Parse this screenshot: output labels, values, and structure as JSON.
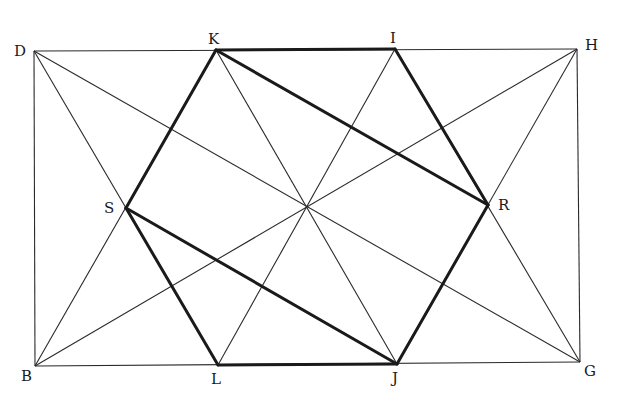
{
  "figure": {
    "type": "geometric-construction",
    "points": {
      "D": {
        "x": 34,
        "y": 51,
        "label": "D",
        "lx": 14,
        "ly": 56
      },
      "K": {
        "x": 216,
        "y": 50,
        "label": "K",
        "lx": 208,
        "ly": 44
      },
      "I": {
        "x": 395,
        "y": 49,
        "label": "I",
        "lx": 390,
        "ly": 43
      },
      "H": {
        "x": 577,
        "y": 49,
        "label": "H",
        "lx": 585,
        "ly": 50
      },
      "S": {
        "x": 126,
        "y": 208,
        "label": "S",
        "lx": 104,
        "ly": 213
      },
      "R": {
        "x": 488,
        "y": 205,
        "label": "R",
        "lx": 498,
        "ly": 210
      },
      "B": {
        "x": 35,
        "y": 366,
        "label": "B",
        "lx": 21,
        "ly": 381
      },
      "L": {
        "x": 218,
        "y": 365,
        "label": "L",
        "lx": 211,
        "ly": 384
      },
      "J": {
        "x": 397,
        "y": 364,
        "label": "J",
        "lx": 392,
        "ly": 383
      },
      "G": {
        "x": 580,
        "y": 362,
        "label": "G",
        "lx": 584,
        "ly": 376
      }
    },
    "thin_lines": [
      [
        "D",
        "H"
      ],
      [
        "H",
        "G"
      ],
      [
        "G",
        "B"
      ],
      [
        "B",
        "D"
      ],
      [
        "D",
        "G"
      ],
      [
        "B",
        "H"
      ],
      [
        "K",
        "J"
      ],
      [
        "I",
        "L"
      ],
      [
        "D",
        "L"
      ],
      [
        "B",
        "K"
      ],
      [
        "H",
        "J"
      ],
      [
        "G",
        "I"
      ]
    ],
    "thick_lines": [
      [
        "K",
        "I"
      ],
      [
        "I",
        "R"
      ],
      [
        "R",
        "J"
      ],
      [
        "J",
        "L"
      ],
      [
        "L",
        "S"
      ],
      [
        "S",
        "K"
      ],
      [
        "K",
        "R"
      ],
      [
        "S",
        "J"
      ]
    ]
  }
}
